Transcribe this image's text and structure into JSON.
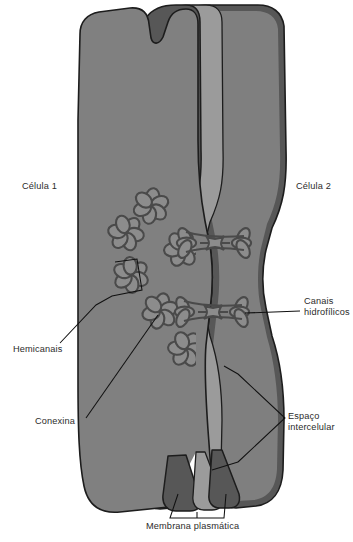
{
  "figure": {
    "type": "biological-diagram",
    "language": "pt-BR",
    "background_color": "#ffffff"
  },
  "colors": {
    "cytoplasm_cell1": "#808080",
    "cytoplasm_cell2": "#828282",
    "membrane_dark": "#575757",
    "intercellular_space": "#9b9b9b",
    "outline": "#1d1d1d",
    "connexon_fill": "#8c8c8c",
    "connexon_stroke": "#4a4a4a",
    "label_text": "#2b2b2b",
    "leader_line": "#111111"
  },
  "labels": {
    "cell1": {
      "text": "Célula 1",
      "x": 22,
      "y": 186
    },
    "cell2": {
      "text": "Célula 2",
      "x": 296,
      "y": 186
    },
    "hydrophilic_channels": {
      "text": "Canais\nhidrofílicos",
      "x": 305,
      "y": 300
    },
    "intercellular_space": {
      "text": "Espaço\nintercelular",
      "x": 288,
      "y": 415
    },
    "hemichannels": {
      "text": "Hemicanais",
      "x": 14,
      "y": 348
    },
    "connexin": {
      "text": "Conexina",
      "x": 36,
      "y": 421
    },
    "plasma_membrane": {
      "text": "Membrana plasmática",
      "x": 146,
      "y": 525
    }
  },
  "structures": {
    "connexons_cell1": [
      {
        "id": "connexon-1",
        "cx": 151,
        "cy": 206,
        "r": 17,
        "rot": 10
      },
      {
        "id": "connexon-2",
        "cx": 126,
        "cy": 233,
        "r": 16,
        "rot": 40
      },
      {
        "id": "connexon-3",
        "cx": 182,
        "cy": 249,
        "r": 17,
        "rot": 25
      },
      {
        "id": "connexon-4",
        "cx": 131,
        "cy": 275,
        "r": 16,
        "rot": 55
      },
      {
        "id": "connexon-5",
        "cx": 160,
        "cy": 311,
        "r": 17,
        "rot": 15
      },
      {
        "id": "connexon-6",
        "cx": 186,
        "cy": 349,
        "r": 16,
        "rot": 35
      }
    ],
    "gap_junctions": [
      {
        "id": "gap-junction-upper",
        "cy": 243,
        "label_ref": "hydrophilic_channels"
      },
      {
        "id": "gap-junction-lower",
        "cy": 312,
        "label_ref": "hydrophilic_channels"
      }
    ],
    "membrane_layers": [
      "cell1-plasma-membrane",
      "intercellular-space",
      "cell2-plasma-membrane"
    ]
  }
}
